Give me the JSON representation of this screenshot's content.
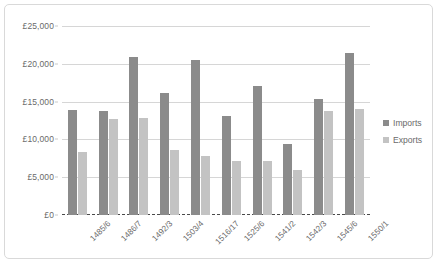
{
  "chart_data": {
    "type": "bar",
    "title": "",
    "xlabel": "",
    "ylabel": "",
    "ylim": [
      0,
      25000
    ],
    "ytick_values": [
      0,
      5000,
      10000,
      15000,
      20000,
      25000
    ],
    "ytick_labels": [
      "£0",
      "£5,000",
      "£10,000",
      "£15,000",
      "£20,000",
      "£25,000"
    ],
    "grid": true,
    "legend_position": "right",
    "categories": [
      "1485/6",
      "1486/7",
      "1492/3",
      "1503/4",
      "1516/17",
      "1525/6",
      "1541/2",
      "1542/3",
      "1545/6",
      "1550/1"
    ],
    "series": [
      {
        "name": "Imports",
        "color": "#8b8b8b",
        "values": [
          13900,
          13800,
          20900,
          16100,
          20500,
          13100,
          17000,
          9450,
          15400,
          21400
        ]
      },
      {
        "name": "Exports",
        "color": "#c3c3c3",
        "values": [
          8400,
          12700,
          12800,
          8650,
          7800,
          7150,
          7150,
          5950,
          13800,
          14000
        ]
      }
    ]
  },
  "legend": {
    "items": [
      {
        "label": "Imports"
      },
      {
        "label": "Exports"
      }
    ]
  }
}
